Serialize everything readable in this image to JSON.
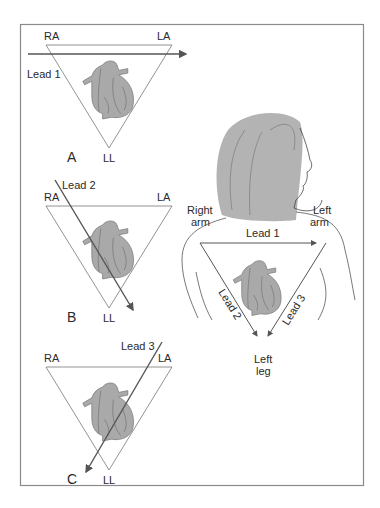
{
  "figure": {
    "colors": {
      "border": "#8a8a8a",
      "line": "#555555",
      "heart_fill": "#a9a9a9",
      "hair": "#b3b3b3",
      "text": "#2a2a2a"
    }
  },
  "panels": [
    {
      "id": "A",
      "letter": "A",
      "ra": "RA",
      "la": "LA",
      "ll": "LL",
      "lead": "Lead 1"
    },
    {
      "id": "B",
      "letter": "B",
      "ra": "RA",
      "la": "LA",
      "ll": "LL",
      "lead": "Lead 2"
    },
    {
      "id": "C",
      "letter": "C",
      "ra": "RA",
      "la": "LA",
      "ll": "LL",
      "lead": "Lead 3"
    }
  ],
  "body_figure": {
    "right_arm": [
      "Right",
      "arm"
    ],
    "left_arm": [
      "Left",
      "arm"
    ],
    "left_leg": [
      "Left",
      "leg"
    ],
    "lead1": "Lead 1",
    "lead2": "Lead 2",
    "lead3": "Lead 3"
  }
}
